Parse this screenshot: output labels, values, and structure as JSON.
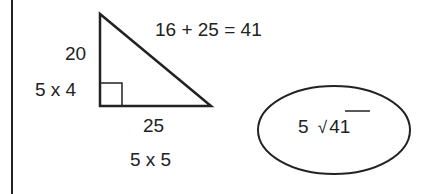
{
  "diagram": {
    "hypotenuse_equation": "16 + 25 = 41",
    "vertical_leg": {
      "value": "20",
      "factored": "5 x 4"
    },
    "horizontal_leg": {
      "value": "25",
      "factored": "5 x 5"
    },
    "answer": {
      "coefficient": "5",
      "radical_symbol": "√",
      "radicand": "41"
    }
  }
}
